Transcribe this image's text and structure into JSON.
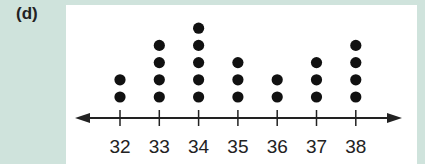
{
  "label": "(d)",
  "chart_data": {
    "type": "dot_plot",
    "title": "",
    "xlabel": "",
    "ylabel": "",
    "categories": [
      "32",
      "33",
      "34",
      "35",
      "36",
      "37",
      "38"
    ],
    "values": [
      2,
      4,
      5,
      3,
      2,
      3,
      4
    ],
    "axis": {
      "arrows": "both",
      "grid": false
    }
  },
  "colors": {
    "background": "#cfe3dc",
    "panel": "#ffffff",
    "dot": "#111111",
    "axis": "#222222"
  }
}
